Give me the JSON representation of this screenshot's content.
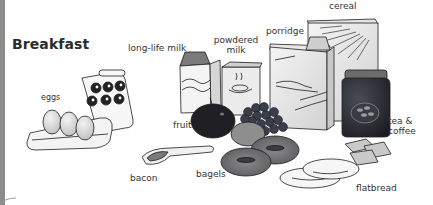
{
  "title": "Breakfast",
  "items": [
    {
      "id": "long-life-milk",
      "label": "long-life milk"
    },
    {
      "id": "powdered-milk",
      "label_line1": "powdered",
      "label_line2": "milk"
    },
    {
      "id": "porridge",
      "label": "porridge"
    },
    {
      "id": "cereal",
      "label": "cereal"
    },
    {
      "id": "eggs",
      "label": "eggs"
    },
    {
      "id": "fruit",
      "label": "fruit"
    },
    {
      "id": "tea-coffee",
      "label_line1": "tea &",
      "label_line2": "coffee"
    },
    {
      "id": "bacon",
      "label": "bacon"
    },
    {
      "id": "bagels",
      "label": "bagels"
    },
    {
      "id": "flatbread",
      "label": "flatbread"
    }
  ],
  "colors": {
    "background": "#ffffff",
    "text": "#2b2b2b",
    "page_edge": "#8c8c8c",
    "line_art": "#1e1e1e",
    "jar_dark": "#2f2f35",
    "apple_dark": "#1f1f24",
    "grapes": "#3a3d4a",
    "bagel": "#6e6e70"
  }
}
